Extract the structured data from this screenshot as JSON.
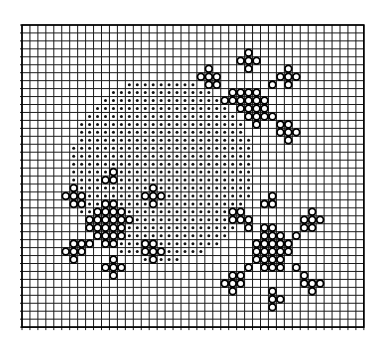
{
  "figure": {
    "grid": {
      "origin_x": 22,
      "origin_y": 25,
      "cell_size": 7.95,
      "cols": 43,
      "rows": 38,
      "line_color": "#1a1a1a",
      "frame_color": "#000000"
    },
    "disk": {
      "center_col": 17.6,
      "center_row": 18.2,
      "radius_cells": 11.6,
      "dot_color": "#111111",
      "dot_radius": 1.5
    },
    "rings": {
      "stroke_color": "#000000",
      "fill_color": "#ffffff",
      "radius": 3.4,
      "stroke_width": 1.8,
      "cells": [
        [
          28,
          3
        ],
        [
          27,
          4
        ],
        [
          28,
          4
        ],
        [
          29,
          4
        ],
        [
          28,
          5
        ],
        [
          23,
          5
        ],
        [
          22,
          6
        ],
        [
          23,
          6
        ],
        [
          24,
          6
        ],
        [
          23,
          7
        ],
        [
          24,
          7
        ],
        [
          33,
          5
        ],
        [
          32,
          6
        ],
        [
          33,
          6
        ],
        [
          34,
          6
        ],
        [
          33,
          7
        ],
        [
          26,
          8
        ],
        [
          27,
          8
        ],
        [
          28,
          8
        ],
        [
          29,
          8
        ],
        [
          25,
          9
        ],
        [
          26,
          9
        ],
        [
          27,
          9
        ],
        [
          28,
          9
        ],
        [
          29,
          9
        ],
        [
          30,
          9
        ],
        [
          27,
          10
        ],
        [
          28,
          10
        ],
        [
          29,
          10
        ],
        [
          30,
          10
        ],
        [
          28,
          11
        ],
        [
          29,
          11
        ],
        [
          30,
          11
        ],
        [
          31,
          11
        ],
        [
          29,
          12
        ],
        [
          31,
          7
        ],
        [
          32,
          12
        ],
        [
          33,
          12
        ],
        [
          32,
          13
        ],
        [
          33,
          13
        ],
        [
          34,
          13
        ],
        [
          33,
          14
        ],
        [
          31,
          21
        ],
        [
          30,
          22
        ],
        [
          31,
          22
        ],
        [
          26,
          23
        ],
        [
          27,
          23
        ],
        [
          26,
          24
        ],
        [
          27,
          24
        ],
        [
          28,
          24
        ],
        [
          28,
          25
        ],
        [
          36,
          23
        ],
        [
          35,
          24
        ],
        [
          36,
          24
        ],
        [
          37,
          24
        ],
        [
          35,
          25
        ],
        [
          36,
          25
        ],
        [
          34,
          26
        ],
        [
          30,
          25
        ],
        [
          31,
          25
        ],
        [
          30,
          26
        ],
        [
          31,
          26
        ],
        [
          32,
          26
        ],
        [
          29,
          27
        ],
        [
          30,
          27
        ],
        [
          31,
          27
        ],
        [
          32,
          27
        ],
        [
          33,
          27
        ],
        [
          29,
          28
        ],
        [
          30,
          28
        ],
        [
          31,
          28
        ],
        [
          32,
          28
        ],
        [
          33,
          28
        ],
        [
          29,
          29
        ],
        [
          30,
          29
        ],
        [
          31,
          29
        ],
        [
          32,
          29
        ],
        [
          28,
          30
        ],
        [
          30,
          30
        ],
        [
          31,
          30
        ],
        [
          32,
          30
        ],
        [
          34,
          30
        ],
        [
          26,
          31
        ],
        [
          27,
          31
        ],
        [
          25,
          32
        ],
        [
          26,
          32
        ],
        [
          27,
          32
        ],
        [
          26,
          33
        ],
        [
          35,
          31
        ],
        [
          35,
          32
        ],
        [
          36,
          32
        ],
        [
          37,
          32
        ],
        [
          36,
          33
        ],
        [
          31,
          33
        ],
        [
          31,
          34
        ],
        [
          32,
          34
        ],
        [
          31,
          35
        ],
        [
          11,
          18
        ],
        [
          10,
          19
        ],
        [
          11,
          19
        ],
        [
          6,
          20
        ],
        [
          5,
          21
        ],
        [
          6,
          21
        ],
        [
          7,
          21
        ],
        [
          6,
          22
        ],
        [
          7,
          22
        ],
        [
          16,
          20
        ],
        [
          15,
          21
        ],
        [
          16,
          21
        ],
        [
          17,
          21
        ],
        [
          16,
          22
        ],
        [
          10,
          22
        ],
        [
          11,
          22
        ],
        [
          9,
          23
        ],
        [
          10,
          23
        ],
        [
          11,
          23
        ],
        [
          12,
          23
        ],
        [
          8,
          24
        ],
        [
          9,
          24
        ],
        [
          10,
          24
        ],
        [
          11,
          24
        ],
        [
          12,
          24
        ],
        [
          13,
          24
        ],
        [
          8,
          25
        ],
        [
          9,
          25
        ],
        [
          10,
          25
        ],
        [
          11,
          25
        ],
        [
          12,
          25
        ],
        [
          9,
          26
        ],
        [
          10,
          26
        ],
        [
          11,
          26
        ],
        [
          12,
          26
        ],
        [
          8,
          27
        ],
        [
          10,
          27
        ],
        [
          11,
          27
        ],
        [
          6,
          27
        ],
        [
          7,
          27
        ],
        [
          5,
          28
        ],
        [
          6,
          28
        ],
        [
          7,
          28
        ],
        [
          6,
          29
        ],
        [
          15,
          27
        ],
        [
          16,
          27
        ],
        [
          15,
          28
        ],
        [
          16,
          28
        ],
        [
          17,
          28
        ],
        [
          16,
          29
        ],
        [
          11,
          29
        ],
        [
          10,
          30
        ],
        [
          11,
          30
        ],
        [
          12,
          30
        ],
        [
          11,
          31
        ]
      ]
    }
  }
}
